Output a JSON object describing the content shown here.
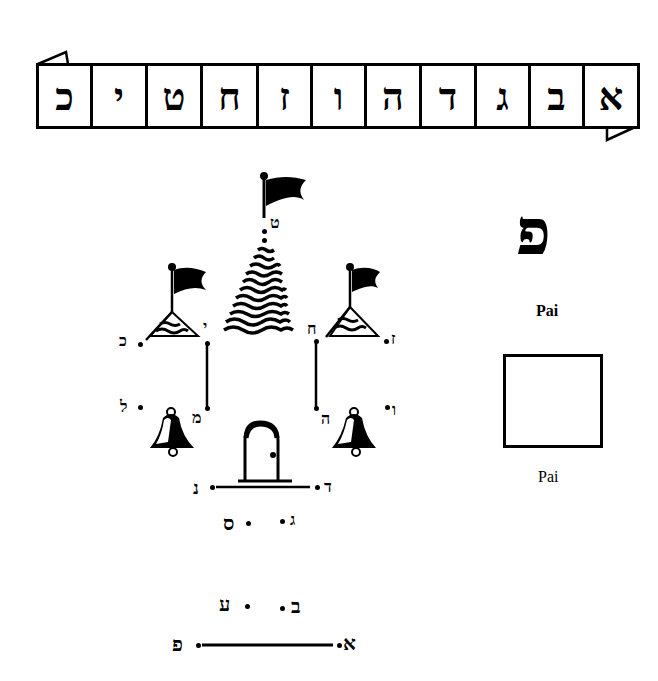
{
  "banner": {
    "letters": [
      "כ",
      "י",
      "ט",
      "ח",
      "ז",
      "ו",
      "ה",
      "ד",
      "ג",
      "ב",
      "א"
    ]
  },
  "puzzle": {
    "dots": {
      "tet": "ט",
      "chet": "ח",
      "yod": "י",
      "kaf": "כ",
      "zayin": "ז",
      "lamed": "ל",
      "mem": "מ",
      "hey": "ה",
      "vav": "ו",
      "nun": "נ",
      "dalet": "ד",
      "samech": "ס",
      "gimel": "ג",
      "ayin": "ע",
      "bet": "ב",
      "pe": "פ",
      "alef": "א"
    }
  },
  "sidebar": {
    "big_letter": "פ",
    "label_bold": "Pai",
    "label_plain": "Pai"
  }
}
